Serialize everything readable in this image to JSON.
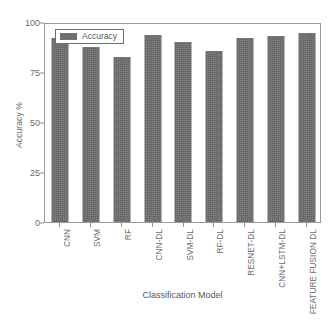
{
  "chart_data": {
    "type": "bar",
    "title": "",
    "xlabel": "Classification Model",
    "ylabel": "Accuracy %",
    "categories": [
      "CNN",
      "SVM",
      "RF",
      "CNN-DL",
      "SVM-DL",
      "RF-DL",
      "RESNET-DL",
      "CNN+LSTM-DL",
      "FEATURE FUSION DL"
    ],
    "values": [
      93,
      88.5,
      83.5,
      94.5,
      91,
      86.5,
      93,
      94,
      95.5
    ],
    "series": [
      {
        "name": "Accuracy",
        "values": [
          93,
          88.5,
          83.5,
          94.5,
          91,
          86.5,
          93,
          94,
          95.5
        ]
      }
    ],
    "ylim": [
      0,
      100
    ],
    "yticks": [
      0,
      25,
      50,
      75,
      100
    ],
    "ytick_labels": [
      "0",
      "25",
      "50",
      "75",
      "100"
    ],
    "grid": false,
    "legend_position": "top-left-inside",
    "bar_color": "#6e6e70",
    "axis_color": "#9a9a9c",
    "text_color": "#58585a"
  },
  "legend": {
    "label": "Accuracy",
    "swatch_color": "#6e6e70"
  },
  "axes": {
    "y_title": "Accuracy %",
    "x_title": "Classification Model"
  },
  "caption": {
    "text": ""
  }
}
